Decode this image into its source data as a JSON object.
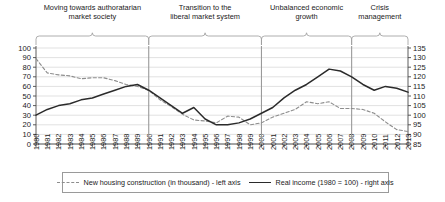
{
  "periods": [
    {
      "label": "Moving towards authoratarian\nmarket society",
      "start_year": 1980,
      "end_year": 1990
    },
    {
      "label": "Transition to the\nliberal market system",
      "start_year": 1990,
      "end_year": 2000
    },
    {
      "label": "Unbalanced economic\ngrowth",
      "start_year": 2000,
      "end_year": 2008
    },
    {
      "label": "Crisis\nmanagement",
      "start_year": 2008,
      "end_year": 2013
    }
  ],
  "legend": [
    {
      "name": "new-housing-construction",
      "label": "New housing construction (in thousand) - left axis",
      "style": "dashed",
      "color": "#8d8d8d"
    },
    {
      "name": "real-income",
      "label": "Real income (1980 = 100) - right axis",
      "style": "solid",
      "color": "#2b2b2b"
    }
  ],
  "colors": {
    "series_housing": "#8d8d8d",
    "series_income": "#2b2b2b",
    "gridline": "#d4d4d4",
    "axis": "#4a4a4a",
    "divider": "#9a9a9a",
    "brace": "#9a9a9a"
  },
  "chart_data": {
    "type": "line",
    "title": "",
    "xlabel": "",
    "grid": true,
    "legend_position": "bottom",
    "x": [
      1980,
      1981,
      1982,
      1983,
      1984,
      1985,
      1986,
      1987,
      1988,
      1989,
      1990,
      1991,
      1992,
      1993,
      1994,
      1995,
      1996,
      1997,
      1998,
      1999,
      2000,
      2001,
      2002,
      2003,
      2004,
      2005,
      2006,
      2007,
      2008,
      2009,
      2010,
      2011,
      2012,
      2013
    ],
    "xtick_labels": [
      "1980",
      "1981",
      "1982",
      "1983",
      "1984",
      "1985",
      "1986",
      "1987",
      "1988",
      "1989",
      "1990",
      "1991",
      "1992",
      "1993",
      "1994",
      "1995",
      "1996",
      "1997",
      "1998",
      "1999",
      "2000",
      "2001",
      "2002",
      "2003",
      "2004",
      "2005",
      "2006",
      "2007",
      "2008",
      "2009",
      "2010",
      "2011",
      "2012",
      "2013"
    ],
    "axes": [
      {
        "id": "left",
        "ylabel": "New housing construction (in thousand)",
        "ylim": [
          0,
          100
        ],
        "yticks": [
          0,
          10,
          20,
          30,
          40,
          50,
          60,
          70,
          80,
          90,
          100
        ]
      },
      {
        "id": "right",
        "ylabel": "Real income (1980 = 100)",
        "ylim": [
          85,
          135
        ],
        "yticks": [
          85,
          90,
          95,
          100,
          105,
          110,
          115,
          120,
          125,
          130,
          135
        ]
      }
    ],
    "series": [
      {
        "name": "New housing construction (in thousand) - left axis",
        "short_name": "new-housing-construction",
        "axis": "left",
        "style": "dashed",
        "color": "#8d8d8d",
        "values": [
          89,
          74,
          72,
          71,
          68,
          69,
          69,
          66,
          62,
          60,
          56,
          46,
          39,
          31,
          25,
          24,
          22,
          29,
          28,
          20,
          22,
          28,
          32,
          36,
          44,
          42,
          44,
          37,
          37,
          36,
          32,
          23,
          15,
          13
        ]
      },
      {
        "name": "Real income (1980 = 100) - right axis",
        "short_name": "real-income",
        "axis": "right",
        "style": "solid",
        "color": "#2b2b2b",
        "values": [
          100,
          103,
          105,
          106,
          108,
          109,
          111,
          113,
          115,
          116,
          113,
          109,
          105,
          101,
          104,
          98,
          95,
          95,
          96,
          98,
          101,
          104,
          109,
          113,
          116,
          120,
          124,
          123,
          120,
          116,
          113,
          115,
          114,
          112
        ]
      }
    ],
    "dividers": [
      1990,
      2000,
      2008
    ]
  }
}
